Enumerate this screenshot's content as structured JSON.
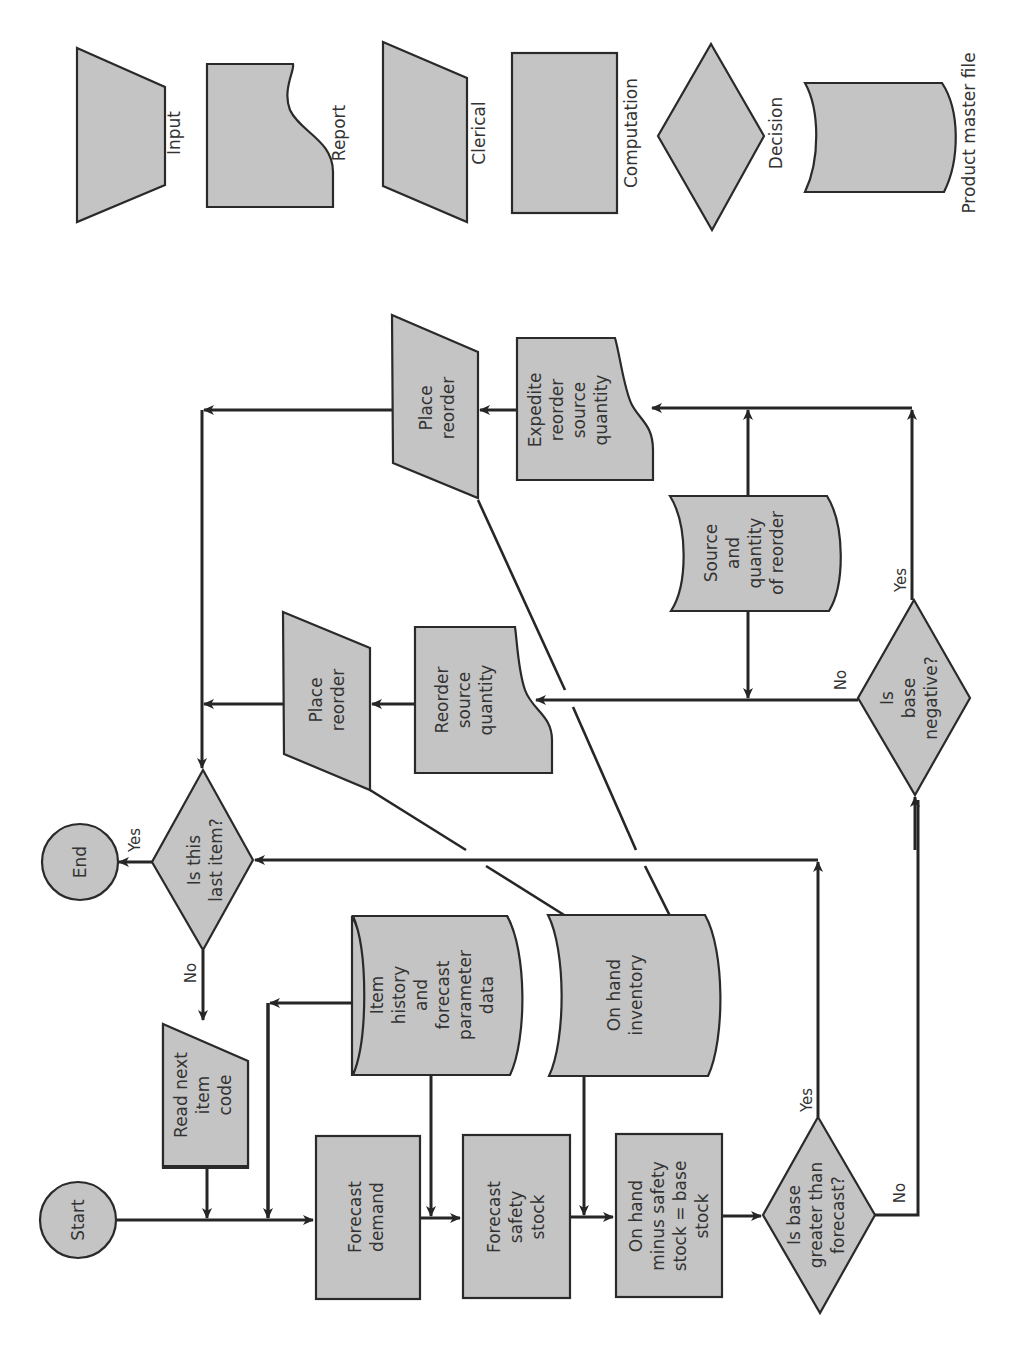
{
  "legend": {
    "input": "Input",
    "report": "Report",
    "clerical": "Clerical",
    "computation": "Computation",
    "decision": "Decision",
    "file": "Product master file"
  },
  "nodes": {
    "start": "Start",
    "end": "End",
    "read_next": [
      "Read next",
      "item",
      "code"
    ],
    "forecast_demand": [
      "Forecast",
      "demand"
    ],
    "forecast_safety": [
      "Forecast",
      "safety",
      "stock"
    ],
    "base_stock": [
      "On hand",
      "minus safety",
      "stock = base",
      "stock"
    ],
    "is_base_greater": [
      "Is base",
      "greater than",
      "forecast?"
    ],
    "is_base_negative": [
      "Is",
      "base",
      "negative?"
    ],
    "is_last_item": [
      "Is this",
      "last item?"
    ],
    "item_history": [
      "Item",
      "history",
      "and",
      "forecast",
      "parameter",
      "data"
    ],
    "on_hand_inventory": [
      "On hand",
      "inventory"
    ],
    "source_quantity": [
      "Source",
      "and",
      "quantity",
      "of reorder"
    ],
    "reorder_source": [
      "Reorder",
      "source",
      "quantity"
    ],
    "expedite_reorder": [
      "Expedite",
      "reorder",
      "source",
      "quantity"
    ],
    "place_reorder_1": [
      "Place",
      "reorder"
    ],
    "place_reorder_2": [
      "Place",
      "reorder"
    ]
  },
  "edge_labels": {
    "last_yes": "Yes",
    "last_no": "No",
    "greater_yes": "Yes",
    "greater_no": "No",
    "negative_yes": "Yes",
    "negative_no": "No"
  },
  "colors": {
    "shape_fill": "#c4c4c4",
    "stroke": "#262626",
    "text": "#333333"
  }
}
